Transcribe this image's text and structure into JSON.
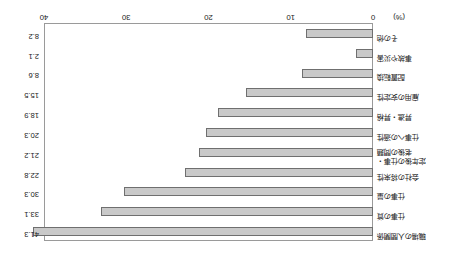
{
  "chart_data": {
    "type": "bar",
    "orientation": "horizontal",
    "title": "",
    "xlabel": "(%)",
    "ylabel": "",
    "xlim": [
      0,
      40
    ],
    "xticks": [
      0,
      10,
      20,
      30,
      40
    ],
    "xticklabels": [
      "0",
      "10",
      "20",
      "30",
      "40"
    ],
    "grid": false,
    "legend": "none",
    "rotated_180": true,
    "unit_label": "(%)",
    "categories": [
      "職場の人間関係",
      "仕事の質",
      "仕事の量",
      "会社の将来性",
      "仕事への適性",
      "昇進・昇給",
      "雇用の安定性",
      "配置転換",
      "事故や災害",
      "その他"
    ],
    "values": [
      41.3,
      33.1,
      30.3,
      22.8,
      21.2,
      20.3,
      18.9,
      15.5,
      8.6,
      8.2
    ],
    "extra_rows": [
      {
        "category": "定年後の仕事・老後の問題",
        "value": 21.2,
        "two_line": true
      }
    ],
    "rows": [
      {
        "label": "職場の人間関係",
        "value": 41.3,
        "value_text": "41.3",
        "two_line": false
      },
      {
        "label": "仕事の質",
        "value": 33.1,
        "value_text": "33.1",
        "two_line": false
      },
      {
        "label": "仕事の量",
        "value": 30.3,
        "value_text": "30.3",
        "two_line": false
      },
      {
        "label": "会社の将来性",
        "value": 22.8,
        "value_text": "22.8",
        "two_line": false
      },
      {
        "label": "定年後の仕事・\n老後の問題",
        "value": 21.2,
        "value_text": "21.2",
        "two_line": true
      },
      {
        "label": "仕事への適性",
        "value": 20.3,
        "value_text": "20.3",
        "two_line": false
      },
      {
        "label": "昇進・昇格",
        "value": 18.9,
        "value_text": "18.9",
        "two_line": false
      },
      {
        "label": "雇用の安定性",
        "value": 15.5,
        "value_text": "15.5",
        "two_line": false
      },
      {
        "label": "配置転換",
        "value": 8.6,
        "value_text": "8.6",
        "two_line": false
      },
      {
        "label": "事故や災害",
        "value": 2.1,
        "value_text": "2.1",
        "two_line": false
      },
      {
        "label": "その他",
        "value": 8.2,
        "value_text": "8.2",
        "two_line": false
      }
    ]
  }
}
